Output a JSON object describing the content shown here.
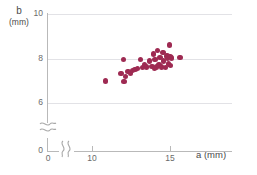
{
  "chart_data": {
    "type": "scatter",
    "title": "",
    "xlabel": "a (mm)",
    "ylabel": "b (mm)",
    "y_axis_name": "b",
    "y_axis_unit": "(mm)",
    "x_axis_name": "a",
    "x_axis_unit": "(mm)",
    "point_color": "#9e2a52",
    "grid": true,
    "grid_color": "#e2e2e6",
    "axis_color": "#b9b9b9",
    "legend": "none",
    "axis_break_x": true,
    "axis_break_y": true,
    "xlim": [
      10,
      16.5
    ],
    "ylim": [
      5.4,
      10
    ],
    "x_origin_label": "0",
    "y_origin_label": "0",
    "xticks": [
      10,
      15
    ],
    "xtick_labels": [
      "10",
      "15"
    ],
    "yticks": [
      6,
      8,
      10
    ],
    "ytick_labels": [
      "6",
      "8",
      "10"
    ],
    "points": [
      {
        "x": 10.85,
        "y": 6.99
      },
      {
        "x": 11.85,
        "y": 7.33
      },
      {
        "x": 12.0,
        "y": 7.95
      },
      {
        "x": 12.05,
        "y": 6.97
      },
      {
        "x": 12.15,
        "y": 7.18
      },
      {
        "x": 12.3,
        "y": 7.42
      },
      {
        "x": 12.45,
        "y": 7.33
      },
      {
        "x": 12.6,
        "y": 7.45
      },
      {
        "x": 12.75,
        "y": 7.5
      },
      {
        "x": 12.9,
        "y": 7.55
      },
      {
        "x": 13.1,
        "y": 7.95
      },
      {
        "x": 13.25,
        "y": 7.6
      },
      {
        "x": 13.35,
        "y": 7.72
      },
      {
        "x": 13.5,
        "y": 7.62
      },
      {
        "x": 13.7,
        "y": 7.88
      },
      {
        "x": 13.85,
        "y": 7.65
      },
      {
        "x": 13.95,
        "y": 8.2
      },
      {
        "x": 14.0,
        "y": 7.55
      },
      {
        "x": 14.05,
        "y": 7.95
      },
      {
        "x": 14.15,
        "y": 7.62
      },
      {
        "x": 14.2,
        "y": 8.35
      },
      {
        "x": 14.3,
        "y": 7.7
      },
      {
        "x": 14.35,
        "y": 8.05
      },
      {
        "x": 14.45,
        "y": 7.62
      },
      {
        "x": 14.55,
        "y": 8.28
      },
      {
        "x": 14.6,
        "y": 7.88
      },
      {
        "x": 14.7,
        "y": 7.6
      },
      {
        "x": 14.8,
        "y": 8.12
      },
      {
        "x": 14.85,
        "y": 8.0
      },
      {
        "x": 14.9,
        "y": 7.75
      },
      {
        "x": 14.95,
        "y": 8.6
      },
      {
        "x": 15.0,
        "y": 8.08
      },
      {
        "x": 15.05,
        "y": 7.68
      },
      {
        "x": 15.1,
        "y": 8.02
      },
      {
        "x": 15.65,
        "y": 8.05
      }
    ]
  }
}
